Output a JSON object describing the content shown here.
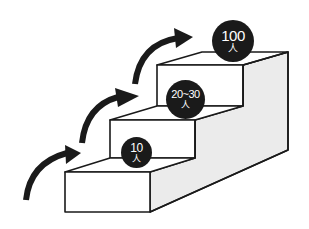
{
  "diagram": {
    "type": "staircase-growth",
    "colors": {
      "outline": "#1a1a1a",
      "step_face": "#ffffff",
      "side_face": "#ebebeb",
      "arrow": "#1a1a1a",
      "badge_bg": "#1a1a1a",
      "badge_text": "#ffffff"
    },
    "steps": [
      {
        "level": 1,
        "number": "10",
        "unit": "人"
      },
      {
        "level": 2,
        "number": "20~30",
        "unit": "人"
      },
      {
        "level": 3,
        "number": "100",
        "unit": "人"
      }
    ],
    "arrows": [
      {
        "name": "arrow-step-1",
        "icon": "curved-arrow-up-right"
      },
      {
        "name": "arrow-step-2",
        "icon": "curved-arrow-up-right"
      },
      {
        "name": "arrow-step-3",
        "icon": "curved-arrow-up-right"
      },
      {
        "name": "arrow-step-4",
        "icon": "curved-arrow-up-right"
      }
    ]
  }
}
